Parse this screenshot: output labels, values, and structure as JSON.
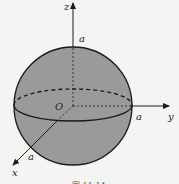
{
  "diagram": {
    "type": "3d-sphere-coordinate-axes",
    "axes": {
      "z": {
        "label": "z",
        "intercept_label": "a"
      },
      "y": {
        "label": "y",
        "intercept_label": "a"
      },
      "x": {
        "label": "x",
        "intercept_label": "a"
      }
    },
    "origin_label": "O",
    "caption": "图 11-14",
    "colors": {
      "sphere_fill": "#9a9a9a",
      "stroke": "#1a1a1a",
      "background": "#f4f4f2"
    }
  }
}
